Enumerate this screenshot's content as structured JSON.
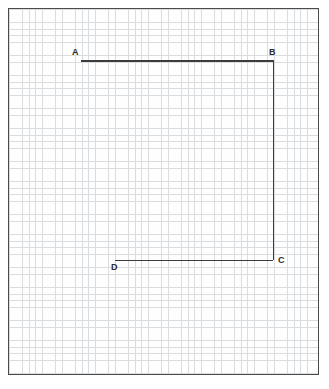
{
  "figure": {
    "kind": "graph-paper-diagram",
    "background_color": "#ffffff",
    "sheet": {
      "border_color": "#4a4a4a",
      "fill_color": "#fefefe",
      "left": 8,
      "top": 8,
      "width": 311,
      "height": 367
    },
    "grid": {
      "minor_color": "#d9dde0",
      "major_color": "#6f7276",
      "minor_spacing_px": 6.625,
      "major_spacing_px": 53,
      "minor_per_major": 8
    },
    "path_color": "#3c3c3c",
    "path_width_px": 1.6
  },
  "vertices": [
    {
      "id": "A",
      "label": "A",
      "x": 80,
      "y": 60,
      "label_x": 71,
      "label_y": 47
    },
    {
      "id": "B",
      "label": "B",
      "x": 272,
      "y": 60,
      "label_x": 268,
      "label_y": 47
    },
    {
      "id": "C",
      "label": "C",
      "x": 272,
      "y": 259,
      "label_x": 277,
      "label_y": 255
    },
    {
      "id": "D",
      "label": "D",
      "x": 114,
      "y": 259,
      "label_x": 110,
      "label_y": 262
    }
  ],
  "segments": [
    {
      "name": "segment-AB",
      "from": "A",
      "to": "B",
      "orientation": "horizontal",
      "left": 80,
      "top": 59.2,
      "length": 193
    },
    {
      "name": "segment-BC",
      "from": "B",
      "to": "C",
      "orientation": "vertical",
      "left": 271.6,
      "top": 59.2,
      "length": 200
    },
    {
      "name": "segment-DC",
      "from": "D",
      "to": "C",
      "orientation": "horizontal",
      "left": 114,
      "top": 258.6,
      "length": 158
    }
  ]
}
